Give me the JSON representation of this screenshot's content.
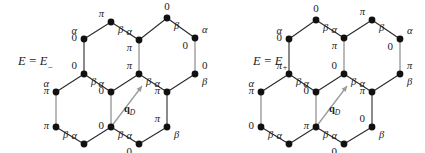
{
  "figure": {
    "type": "two-panel-honeycomb-lattice-diagram",
    "background_color": "#ffffff",
    "node_color": "#111111",
    "bond_dark_color": "#2b2b2b",
    "bond_light_color": "#a8a8a8",
    "arrow_color": "#9a9a9a",
    "text_color": "#1a1a1a"
  },
  "panels": [
    {
      "id": "left-panel",
      "energy_label": {
        "lhs": "E",
        "eq": "=",
        "rhs": "E",
        "subscript": "−",
        "text": "E = E−"
      },
      "arrow_label": {
        "vector": "q",
        "subscript": "D",
        "text": "q_D"
      },
      "nodes": [
        {
          "id": "L-t2",
          "x": 111,
          "y": 22,
          "phase": "π",
          "phase_pos": "above-left",
          "sub": "β",
          "sub_pos": "below-right"
        },
        {
          "id": "L-t4",
          "x": 167,
          "y": 18,
          "phase": "0",
          "phase_pos": "above",
          "sub": "β",
          "sub_pos": "below-right"
        },
        {
          "id": "L-u1",
          "x": 84,
          "y": 39,
          "phase": "0",
          "phase_pos": "left",
          "sub": "α",
          "sub_pos": "above-left"
        },
        {
          "id": "L-u3",
          "x": 139,
          "y": 40,
          "phase": "π",
          "phase_pos": "below-left",
          "sub": "α",
          "sub_pos": "above-left"
        },
        {
          "id": "L-u5",
          "x": 195,
          "y": 38,
          "phase": "0",
          "phase_pos": "below-left",
          "sub": "α",
          "sub_pos": "above-right"
        },
        {
          "id": "L-m1",
          "x": 84,
          "y": 74,
          "phase": "0",
          "phase_pos": "above-left",
          "sub": "β",
          "sub_pos": "below-right"
        },
        {
          "id": "L-m3",
          "x": 139,
          "y": 74,
          "phase": "π",
          "phase_pos": "above-left",
          "sub": "β",
          "sub_pos": "below-right"
        },
        {
          "id": "L-m5",
          "x": 195,
          "y": 74,
          "phase": "0",
          "phase_pos": "above-right",
          "sub": "β",
          "sub_pos": "below-right"
        },
        {
          "id": "L-c0",
          "x": 56,
          "y": 92,
          "phase": "π",
          "phase_pos": "left",
          "sub": "α",
          "sub_pos": "above-left"
        },
        {
          "id": "L-c2",
          "x": 111,
          "y": 92,
          "phase": "0",
          "phase_pos": "left",
          "sub": "α",
          "sub_pos": "above-left"
        },
        {
          "id": "L-c4",
          "x": 167,
          "y": 92,
          "phase": "π",
          "phase_pos": "left",
          "sub": "α",
          "sub_pos": "above-left"
        },
        {
          "id": "L-b0",
          "x": 56,
          "y": 127,
          "phase": "π",
          "phase_pos": "left",
          "sub": "β",
          "sub_pos": "below-right"
        },
        {
          "id": "L-b2",
          "x": 111,
          "y": 127,
          "phase": "0",
          "phase_pos": "left",
          "sub": "β",
          "sub_pos": "below-right"
        },
        {
          "id": "L-b4",
          "x": 167,
          "y": 127,
          "phase": "π",
          "phase_pos": "above-left",
          "sub": "β",
          "sub_pos": "below-right"
        },
        {
          "id": "L-n1",
          "x": 84,
          "y": 144,
          "phase": "π",
          "phase_pos": "below",
          "sub": "α",
          "sub_pos": "above-left"
        },
        {
          "id": "L-n3",
          "x": 139,
          "y": 144,
          "phase": "0",
          "phase_pos": "below-left",
          "sub": "α",
          "sub_pos": "above-left"
        }
      ],
      "bonds": [
        {
          "a": "L-u1",
          "b": "L-t2",
          "shade": "dark"
        },
        {
          "a": "L-t2",
          "b": "L-u3",
          "shade": "dark"
        },
        {
          "a": "L-u3",
          "b": "L-t4",
          "shade": "dark"
        },
        {
          "a": "L-t4",
          "b": "L-u5",
          "shade": "dark"
        },
        {
          "a": "L-u1",
          "b": "L-m1",
          "shade": "dark"
        },
        {
          "a": "L-u3",
          "b": "L-m3",
          "shade": "light"
        },
        {
          "a": "L-u5",
          "b": "L-m5",
          "shade": "light"
        },
        {
          "a": "L-c0",
          "b": "L-m1",
          "shade": "dark"
        },
        {
          "a": "L-m1",
          "b": "L-c2",
          "shade": "dark"
        },
        {
          "a": "L-c2",
          "b": "L-m3",
          "shade": "dark"
        },
        {
          "a": "L-m3",
          "b": "L-c4",
          "shade": "dark"
        },
        {
          "a": "L-c4",
          "b": "L-m5",
          "shade": "dark"
        },
        {
          "a": "L-c0",
          "b": "L-b0",
          "shade": "light"
        },
        {
          "a": "L-c2",
          "b": "L-b2",
          "shade": "light"
        },
        {
          "a": "L-c4",
          "b": "L-b4",
          "shade": "dark"
        },
        {
          "a": "L-b0",
          "b": "L-n1",
          "shade": "dark"
        },
        {
          "a": "L-n1",
          "b": "L-b2",
          "shade": "dark"
        },
        {
          "a": "L-b2",
          "b": "L-n3",
          "shade": "dark"
        },
        {
          "a": "L-n3",
          "b": "L-b4",
          "shade": "dark"
        }
      ],
      "arrow": {
        "from_x": 111,
        "from_y": 127,
        "to_x": 142,
        "to_y": 86,
        "label_x": 124,
        "label_y": 112
      }
    },
    {
      "id": "right-panel",
      "energy_label": {
        "lhs": "E",
        "eq": "=",
        "rhs": "E",
        "subscript": "+",
        "text": "E = E+"
      },
      "arrow_label": {
        "vector": "q",
        "subscript": "D",
        "text": "q_D"
      },
      "nodes": [
        {
          "id": "R-t2",
          "x": 316,
          "y": 20,
          "phase": "0",
          "phase_pos": "above",
          "sub": "β",
          "sub_pos": "below-right"
        },
        {
          "id": "R-t4",
          "x": 372,
          "y": 20,
          "phase": "π",
          "phase_pos": "above-left",
          "sub": "β",
          "sub_pos": "below-right"
        },
        {
          "id": "R-u1",
          "x": 289,
          "y": 39,
          "phase": "0",
          "phase_pos": "left",
          "sub": "α",
          "sub_pos": "above-left"
        },
        {
          "id": "R-u3",
          "x": 344,
          "y": 38,
          "phase": "π",
          "phase_pos": "below-left",
          "sub": "α",
          "sub_pos": "above-left"
        },
        {
          "id": "R-u5",
          "x": 400,
          "y": 39,
          "phase": "0",
          "phase_pos": "below-left",
          "sub": "α",
          "sub_pos": "above-right"
        },
        {
          "id": "R-m1",
          "x": 289,
          "y": 74,
          "phase": "π",
          "phase_pos": "above-left",
          "sub": "β",
          "sub_pos": "below-right"
        },
        {
          "id": "R-m3",
          "x": 344,
          "y": 74,
          "phase": "0",
          "phase_pos": "above-left",
          "sub": "β",
          "sub_pos": "below-right"
        },
        {
          "id": "R-m5",
          "x": 400,
          "y": 74,
          "phase": "π",
          "phase_pos": "above-right",
          "sub": "β",
          "sub_pos": "below-right"
        },
        {
          "id": "R-c0",
          "x": 261,
          "y": 92,
          "phase": "π",
          "phase_pos": "left",
          "sub": "α",
          "sub_pos": "above-left"
        },
        {
          "id": "R-c2",
          "x": 316,
          "y": 92,
          "phase": "0",
          "phase_pos": "left",
          "sub": "α",
          "sub_pos": "above-left"
        },
        {
          "id": "R-c4",
          "x": 372,
          "y": 92,
          "phase": "π",
          "phase_pos": "left",
          "sub": "α",
          "sub_pos": "above-left"
        },
        {
          "id": "R-b0",
          "x": 261,
          "y": 127,
          "phase": "0",
          "phase_pos": "left",
          "sub": "β",
          "sub_pos": "below-right"
        },
        {
          "id": "R-b2",
          "x": 316,
          "y": 127,
          "phase": "π",
          "phase_pos": "left",
          "sub": "β",
          "sub_pos": "below-right"
        },
        {
          "id": "R-b4",
          "x": 372,
          "y": 127,
          "phase": "0",
          "phase_pos": "above-left",
          "sub": "β",
          "sub_pos": "below-right"
        },
        {
          "id": "R-n1",
          "x": 289,
          "y": 144,
          "phase": "π",
          "phase_pos": "below",
          "sub": "α",
          "sub_pos": "above-left"
        },
        {
          "id": "R-n3",
          "x": 344,
          "y": 144,
          "phase": "0",
          "phase_pos": "below-left",
          "sub": "α",
          "sub_pos": "above-left"
        }
      ],
      "bonds": [
        {
          "a": "R-u1",
          "b": "R-t2",
          "shade": "dark"
        },
        {
          "a": "R-t2",
          "b": "R-u3",
          "shade": "dark"
        },
        {
          "a": "R-u3",
          "b": "R-t4",
          "shade": "dark"
        },
        {
          "a": "R-t4",
          "b": "R-u5",
          "shade": "dark"
        },
        {
          "a": "R-u1",
          "b": "R-m1",
          "shade": "dark"
        },
        {
          "a": "R-u3",
          "b": "R-m3",
          "shade": "light"
        },
        {
          "a": "R-u5",
          "b": "R-m5",
          "shade": "light"
        },
        {
          "a": "R-c0",
          "b": "R-m1",
          "shade": "dark"
        },
        {
          "a": "R-m1",
          "b": "R-c2",
          "shade": "dark"
        },
        {
          "a": "R-c2",
          "b": "R-m3",
          "shade": "dark"
        },
        {
          "a": "R-m3",
          "b": "R-c4",
          "shade": "dark"
        },
        {
          "a": "R-c4",
          "b": "R-m5",
          "shade": "dark"
        },
        {
          "a": "R-c0",
          "b": "R-b0",
          "shade": "light"
        },
        {
          "a": "R-c2",
          "b": "R-b2",
          "shade": "light"
        },
        {
          "a": "R-c4",
          "b": "R-b4",
          "shade": "dark"
        },
        {
          "a": "R-b0",
          "b": "R-n1",
          "shade": "dark"
        },
        {
          "a": "R-n1",
          "b": "R-b2",
          "shade": "dark"
        },
        {
          "a": "R-b2",
          "b": "R-n3",
          "shade": "dark"
        },
        {
          "a": "R-n3",
          "b": "R-b4",
          "shade": "dark"
        }
      ],
      "arrow": {
        "from_x": 316,
        "from_y": 127,
        "to_x": 347,
        "to_y": 86,
        "label_x": 329,
        "label_y": 112
      }
    }
  ]
}
